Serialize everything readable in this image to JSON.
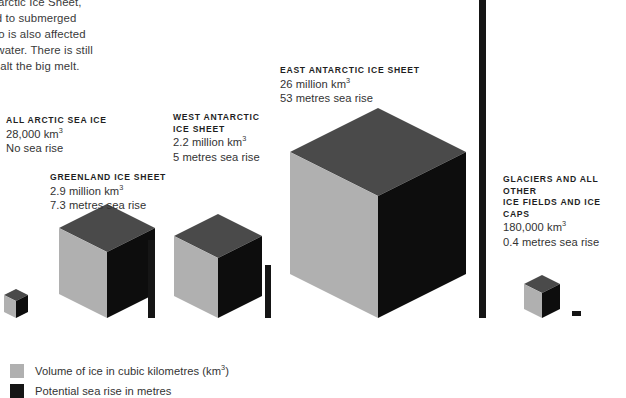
{
  "intro": {
    "text": "g West Antarctic Ice Sheet,\nis anchored to submerged\ntains and so is also affected\nrming sea water. There is still\nhough, to halt the big melt."
  },
  "colors": {
    "cube_top": "#4a4a4a",
    "cube_left": "#b0b0b0",
    "cube_right": "#0d0d0d",
    "bar": "#151515",
    "legend_volume": "#b0b0b0",
    "legend_sea_rise": "#151515",
    "background": "#ffffff",
    "text": "#333333"
  },
  "items": [
    {
      "id": "arctic",
      "title": "ALL ARCTIC SEA ICE",
      "volume": "28,000 km",
      "volume_unit": "3",
      "sea_rise": "No sea rise",
      "volume_km3": 28000,
      "sea_rise_metres": 0
    },
    {
      "id": "greenland",
      "title": "GREENLAND ICE SHEET",
      "volume": "2.9 million km",
      "volume_unit": "3",
      "sea_rise": "7.3 metres sea rise",
      "volume_km3": 2900000,
      "sea_rise_metres": 7.3
    },
    {
      "id": "west-antarctic",
      "title": "WEST ANTARCTIC\nICE SHEET",
      "volume": "2.2 million km",
      "volume_unit": "3",
      "sea_rise": "5 metres sea rise",
      "volume_km3": 2200000,
      "sea_rise_metres": 5
    },
    {
      "id": "east-antarctic",
      "title": "EAST ANTARCTIC ICE SHEET",
      "volume": "26 million km",
      "volume_unit": "3",
      "sea_rise": "53 metres sea rise",
      "volume_km3": 26000000,
      "sea_rise_metres": 53
    },
    {
      "id": "glaciers",
      "title": "GLACIERS AND ALL OTHER\nICE FIELDS AND ICE CAPS",
      "volume": "180,000 km",
      "volume_unit": "3",
      "sea_rise": "0.4 metres sea rise",
      "volume_km3": 180000,
      "sea_rise_metres": 0.4
    }
  ],
  "legend": [
    {
      "id": "volume",
      "swatch": "#b0b0b0",
      "text": "Volume of ice in cubic kilometres (km",
      "unit": "3",
      "text_end": ")"
    },
    {
      "id": "sea-rise",
      "swatch": "#151515",
      "text": "Potential sea rise in metres",
      "unit": "",
      "text_end": ""
    }
  ],
  "geometry": {
    "baseline_y": 318,
    "cubes": [
      {
        "id": "arctic",
        "cx": 16,
        "half_w": 12,
        "height": 17
      },
      {
        "id": "greenland",
        "cx": 107,
        "half_w": 48,
        "height": 66
      },
      {
        "id": "west-antarctic",
        "cx": 218,
        "half_w": 44,
        "height": 60
      },
      {
        "id": "east-antarctic",
        "cx": 378,
        "half_w": 88,
        "height": 122
      },
      {
        "id": "glaciers",
        "cx": 542,
        "half_w": 18,
        "height": 25
      }
    ],
    "bars": [
      {
        "id": "greenland",
        "x": 148,
        "width": 7,
        "top": 240,
        "bottom": 318
      },
      {
        "id": "west-antarctic",
        "x": 265,
        "width": 6,
        "top": 265,
        "bottom": 318
      },
      {
        "id": "east-antarctic",
        "x": 479,
        "width": 7,
        "top": -8,
        "bottom": 318
      },
      {
        "id": "glaciers",
        "x": 572,
        "width": 9,
        "top": 311,
        "bottom": 316
      }
    ]
  }
}
